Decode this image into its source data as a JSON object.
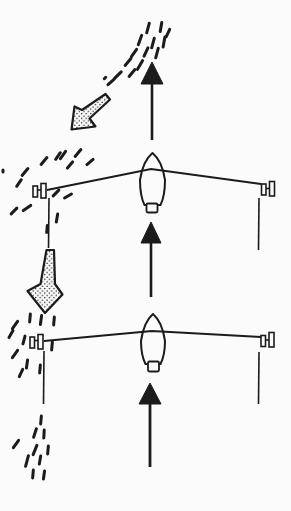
{
  "meta": {
    "ink_color": "#1b1b1b",
    "paper_color": "#fbfbfb",
    "canvas": {
      "width": 291,
      "height": 511
    }
  },
  "scene": {
    "updraft_arrows": [
      {
        "name": "updraft-arrow-top",
        "x": 152,
        "tip_y": 62,
        "head_base_y": 84,
        "half_width": 11,
        "shaft_end_y": 140,
        "shaft_width": 2.6
      },
      {
        "name": "updraft-arrow-middle",
        "x": 151,
        "tip_y": 222,
        "head_base_y": 243,
        "half_width": 10,
        "shaft_end_y": 297,
        "shaft_width": 2.6
      },
      {
        "name": "updraft-arrow-bottom",
        "x": 150,
        "tip_y": 383,
        "head_base_y": 404,
        "half_width": 11,
        "shaft_end_y": 467,
        "shaft_width": 2.8
      }
    ],
    "gust_arrows": [
      {
        "name": "gust-arrow-upper-left",
        "points": [
          [
            105.5,
            94
          ],
          [
            82,
            110
          ],
          [
            74.5,
            106.5
          ],
          [
            71.5,
            129.5
          ],
          [
            95.5,
            126.5
          ],
          [
            89.5,
            118.5
          ],
          [
            110,
            99.5
          ]
        ]
      },
      {
        "name": "gust-arrow-lower-left",
        "points": [
          [
            46.5,
            250
          ],
          [
            40.5,
            284
          ],
          [
            27.5,
            291
          ],
          [
            45,
            313
          ],
          [
            62.5,
            294.5
          ],
          [
            55,
            284
          ],
          [
            54,
            250
          ]
        ]
      }
    ],
    "gliders": [
      {
        "name": "glider-front-view-upper",
        "wing": [
          [
            47,
            190
          ],
          [
            151,
            169
          ],
          [
            261,
            184
          ]
        ],
        "fuselage": {
          "cx": 152.5,
          "nose_y": 153,
          "half_width": 12.5,
          "bottom_y": 205
        },
        "tail_rect": [
          146.5,
          203.5,
          11,
          9
        ],
        "spools": [
          {
            "name": "left-wingtip-marker",
            "rects": [
              [
                33,
                186,
                4.5,
                11
              ],
              [
                41,
                183.5,
                5,
                14.5
              ]
            ],
            "link": [
              37.5,
              190,
              41,
              190
            ]
          },
          {
            "name": "right-wingtip-marker",
            "rects": [
              [
                261.5,
                184,
                4.5,
                11
              ],
              [
                269.5,
                181.5,
                5,
                14.5
              ]
            ],
            "link": [
              266,
              188.5,
              269.5,
              188.5
            ]
          }
        ],
        "drop_lines": [
          [
            49,
            198,
            48.5,
            248
          ],
          [
            259,
            198,
            258.5,
            250
          ]
        ]
      },
      {
        "name": "glider-front-view-lower",
        "wing": [
          [
            44,
            341
          ],
          [
            152,
            331
          ],
          [
            261,
            337
          ]
        ],
        "fuselage": {
          "cx": 153,
          "nose_y": 314,
          "half_width": 12,
          "bottom_y": 364
        },
        "tail_rect": [
          148,
          361.5,
          11,
          10
        ],
        "spools": [
          {
            "name": "left-wingtip-marker",
            "rects": [
              [
                30,
                337,
                4.5,
                11
              ],
              [
                38,
                334.5,
                5,
                14.5
              ]
            ],
            "link": [
              34.5,
              340.5,
              38,
              340.5
            ]
          },
          {
            "name": "right-wingtip-marker",
            "rects": [
              [
                261,
                335.5,
                4.5,
                11
              ],
              [
                269,
                332.5,
                5,
                14.5
              ]
            ],
            "link": [
              265.5,
              340,
              269,
              340
            ]
          }
        ],
        "drop_lines": [
          [
            44,
            351,
            43.5,
            404
          ],
          [
            259,
            352,
            258.5,
            404
          ]
        ]
      }
    ],
    "dash_clusters": [
      {
        "name": "air-dashes-top",
        "dashes": [
          [
            148,
            28,
            10,
            15
          ],
          [
            161,
            27,
            9,
            10
          ],
          [
            168,
            33,
            8,
            25
          ],
          [
            140,
            40,
            10,
            20
          ],
          [
            153,
            43,
            10,
            15
          ],
          [
            164,
            42,
            10,
            10
          ],
          [
            134,
            53,
            9,
            35
          ],
          [
            146,
            52,
            9,
            25
          ],
          [
            157,
            53,
            10,
            15
          ],
          [
            128,
            62,
            9,
            40
          ],
          [
            140,
            65,
            10,
            30
          ],
          [
            118,
            75,
            9,
            45
          ],
          [
            132,
            73,
            9,
            40
          ],
          [
            111,
            82,
            8,
            48
          ],
          [
            105,
            78,
            2,
            45
          ]
        ]
      },
      {
        "name": "air-dashes-upper-left",
        "dashes": [
          [
            78,
            153,
            9,
            40
          ],
          [
            90,
            162,
            8,
            50
          ],
          [
            63,
            155,
            9,
            35
          ],
          [
            70,
            165,
            8,
            40
          ],
          [
            44,
            161,
            9,
            40
          ],
          [
            58,
            156,
            8,
            35
          ],
          [
            25,
            172,
            9,
            40
          ],
          [
            19,
            183,
            8,
            35
          ],
          [
            3,
            171,
            2,
            0
          ],
          [
            56,
            193,
            8,
            45
          ],
          [
            68,
            196,
            8,
            60
          ],
          [
            27,
            208,
            9,
            55
          ],
          [
            14,
            211,
            8,
            45
          ],
          [
            57,
            218,
            8,
            10
          ],
          [
            47,
            229,
            7,
            5
          ]
        ]
      },
      {
        "name": "air-dashes-mid-left",
        "dashes": [
          [
            30,
            318,
            8,
            5
          ],
          [
            41,
            320,
            9,
            8
          ],
          [
            54,
            321,
            8,
            5
          ],
          [
            15,
            325,
            9,
            35
          ],
          [
            11,
            334,
            8,
            30
          ],
          [
            24,
            340,
            8,
            15
          ],
          [
            52,
            346,
            8,
            5
          ],
          [
            15,
            354,
            9,
            35
          ],
          [
            27,
            364,
            8,
            8
          ],
          [
            21,
            373,
            8,
            25
          ],
          [
            40,
            369,
            8,
            5
          ]
        ]
      },
      {
        "name": "air-dashes-bottom-left",
        "dashes": [
          [
            41,
            420,
            8,
            5
          ],
          [
            35,
            433,
            9,
            18
          ],
          [
            44,
            434,
            8,
            3
          ],
          [
            16,
            444,
            9,
            35
          ],
          [
            35,
            450,
            10,
            22
          ],
          [
            48,
            450,
            8,
            5
          ],
          [
            27,
            461,
            11,
            15
          ],
          [
            40,
            460,
            8,
            10
          ],
          [
            33,
            474,
            8,
            5
          ],
          [
            44,
            475,
            8,
            8
          ]
        ]
      }
    ]
  }
}
